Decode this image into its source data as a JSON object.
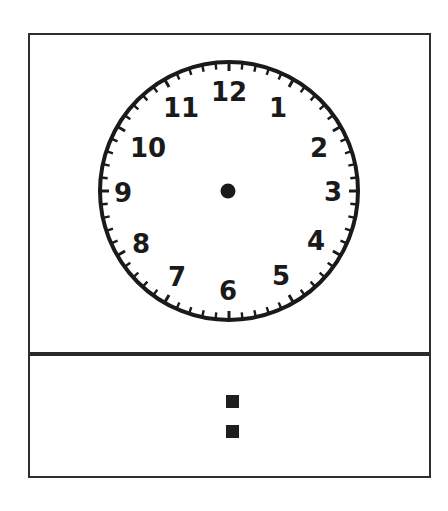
{
  "worksheet": {
    "type": "clock-time-worksheet",
    "clock": {
      "center": {
        "x": 229,
        "y": 191
      },
      "radius": 130,
      "numerals": [
        "12",
        "1",
        "2",
        "3",
        "4",
        "5",
        "6",
        "7",
        "8",
        "9",
        "10",
        "11"
      ],
      "minute_ticks": 60,
      "hands_shown": false,
      "center_dot": true
    },
    "digital_display": {
      "hours": "",
      "separator": ":",
      "minutes": ""
    },
    "colors": {
      "ink": "#1a1a1a",
      "border": "#2e2e2e",
      "background": "#ffffff"
    }
  }
}
